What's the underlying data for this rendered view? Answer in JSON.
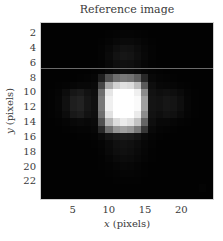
{
  "chart_data": {
    "type": "heatmap",
    "title": "Reference image",
    "xlabel": "x (pixels)",
    "ylabel": "y (pixels)",
    "x_ticks": [
      5,
      10,
      15,
      20
    ],
    "y_ticks": [
      2,
      4,
      6,
      8,
      10,
      12,
      14,
      16,
      18,
      20,
      22
    ],
    "xlim": [
      0.5,
      24.5
    ],
    "ylim": [
      24.5,
      0.5
    ],
    "colormap": "gray",
    "grid": false,
    "artifact_line_y": 6.6,
    "size": [
      24,
      24
    ],
    "values": [
      [
        2,
        2,
        2,
        2,
        2,
        2,
        2,
        2,
        2,
        2,
        2,
        2,
        2,
        2,
        2,
        2,
        2,
        2,
        2,
        2,
        2,
        2,
        2,
        2
      ],
      [
        2,
        2,
        2,
        2,
        2,
        2,
        2,
        2,
        2,
        3,
        4,
        5,
        5,
        4,
        3,
        2,
        2,
        2,
        2,
        2,
        2,
        2,
        2,
        2
      ],
      [
        2,
        2,
        2,
        2,
        2,
        2,
        2,
        2,
        3,
        5,
        8,
        10,
        10,
        8,
        5,
        3,
        2,
        2,
        2,
        2,
        2,
        2,
        2,
        2
      ],
      [
        2,
        2,
        2,
        2,
        2,
        2,
        2,
        2,
        4,
        8,
        14,
        18,
        17,
        12,
        7,
        4,
        2,
        2,
        2,
        2,
        2,
        2,
        2,
        2
      ],
      [
        2,
        2,
        2,
        2,
        2,
        2,
        2,
        2,
        4,
        10,
        18,
        22,
        20,
        14,
        8,
        4,
        2,
        2,
        2,
        2,
        2,
        2,
        2,
        2
      ],
      [
        2,
        2,
        2,
        2,
        2,
        2,
        2,
        2,
        3,
        8,
        14,
        16,
        15,
        11,
        6,
        3,
        2,
        2,
        2,
        2,
        2,
        2,
        2,
        2
      ],
      [
        2,
        2,
        2,
        2,
        2,
        2,
        2,
        3,
        4,
        8,
        12,
        14,
        13,
        10,
        6,
        4,
        3,
        2,
        2,
        2,
        2,
        2,
        2,
        2
      ],
      [
        2,
        2,
        2,
        2,
        2,
        3,
        4,
        6,
        30,
        80,
        110,
        120,
        115,
        95,
        40,
        8,
        5,
        4,
        3,
        2,
        2,
        2,
        2,
        2
      ],
      [
        2,
        2,
        3,
        4,
        6,
        8,
        8,
        10,
        70,
        170,
        210,
        225,
        220,
        190,
        90,
        14,
        8,
        7,
        6,
        4,
        3,
        2,
        2,
        2
      ],
      [
        2,
        3,
        5,
        12,
        22,
        26,
        18,
        14,
        110,
        230,
        255,
        255,
        255,
        240,
        140,
        18,
        14,
        16,
        14,
        10,
        5,
        3,
        2,
        2
      ],
      [
        2,
        3,
        6,
        16,
        30,
        34,
        22,
        16,
        120,
        240,
        255,
        255,
        255,
        250,
        160,
        20,
        18,
        22,
        20,
        14,
        6,
        3,
        2,
        2
      ],
      [
        2,
        3,
        6,
        16,
        30,
        34,
        22,
        16,
        120,
        240,
        255,
        255,
        255,
        250,
        160,
        20,
        18,
        22,
        20,
        14,
        6,
        3,
        2,
        2
      ],
      [
        2,
        3,
        5,
        12,
        24,
        28,
        18,
        14,
        110,
        225,
        255,
        255,
        255,
        235,
        140,
        18,
        14,
        18,
        16,
        10,
        5,
        3,
        2,
        2
      ],
      [
        2,
        2,
        3,
        5,
        8,
        10,
        8,
        10,
        80,
        180,
        220,
        235,
        225,
        195,
        100,
        14,
        8,
        8,
        6,
        4,
        3,
        2,
        2,
        2
      ],
      [
        2,
        2,
        2,
        3,
        4,
        5,
        5,
        7,
        40,
        110,
        150,
        160,
        150,
        120,
        55,
        9,
        5,
        4,
        3,
        2,
        2,
        2,
        2,
        2
      ],
      [
        2,
        2,
        2,
        2,
        2,
        3,
        3,
        4,
        10,
        20,
        26,
        28,
        26,
        20,
        10,
        5,
        3,
        2,
        2,
        2,
        2,
        2,
        2,
        2
      ],
      [
        2,
        2,
        2,
        2,
        2,
        2,
        2,
        3,
        5,
        10,
        16,
        18,
        16,
        12,
        7,
        4,
        2,
        2,
        2,
        2,
        2,
        2,
        2,
        2
      ],
      [
        2,
        2,
        2,
        2,
        2,
        2,
        2,
        2,
        4,
        9,
        14,
        16,
        14,
        10,
        6,
        3,
        2,
        2,
        2,
        2,
        2,
        2,
        2,
        2
      ],
      [
        2,
        2,
        2,
        2,
        2,
        2,
        2,
        2,
        3,
        6,
        10,
        12,
        11,
        8,
        5,
        3,
        2,
        2,
        2,
        2,
        2,
        2,
        2,
        2
      ],
      [
        2,
        2,
        2,
        2,
        2,
        2,
        2,
        2,
        3,
        4,
        6,
        8,
        7,
        5,
        3,
        2,
        2,
        2,
        2,
        2,
        2,
        2,
        2,
        2
      ],
      [
        2,
        2,
        2,
        2,
        2,
        2,
        2,
        2,
        2,
        3,
        4,
        5,
        5,
        4,
        3,
        2,
        2,
        2,
        2,
        2,
        2,
        2,
        2,
        2
      ],
      [
        2,
        2,
        2,
        2,
        2,
        2,
        2,
        2,
        2,
        2,
        3,
        3,
        3,
        3,
        2,
        2,
        2,
        2,
        2,
        2,
        2,
        2,
        2,
        2
      ],
      [
        2,
        2,
        2,
        2,
        2,
        2,
        2,
        2,
        2,
        2,
        2,
        2,
        2,
        2,
        2,
        2,
        2,
        2,
        2,
        2,
        2,
        2,
        4,
        2
      ],
      [
        2,
        2,
        2,
        2,
        2,
        2,
        2,
        2,
        2,
        2,
        2,
        2,
        2,
        2,
        2,
        2,
        2,
        2,
        2,
        2,
        2,
        2,
        2,
        2
      ]
    ]
  },
  "labels": {
    "title": "Reference image",
    "x_axis_var": "x",
    "x_axis_unit": " (pixels)",
    "y_axis_var": "y",
    "y_axis_unit": " (pixels)"
  }
}
